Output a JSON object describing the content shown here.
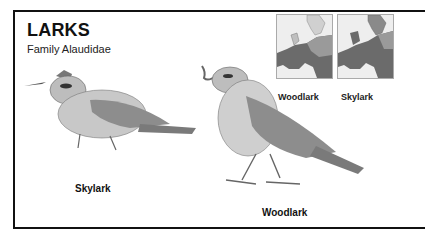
{
  "header": {
    "title": "LARKS",
    "subtitle": "Family Alaudidae"
  },
  "maps": [
    {
      "label": "Woodlark",
      "range_color": "#6b6b6b",
      "land_color": "#d8d8d8"
    },
    {
      "label": "Skylark",
      "range_color": "#6b6b6b",
      "land_color": "#d8d8d8"
    }
  ],
  "birds": [
    {
      "label": "Skylark"
    },
    {
      "label": "Woodlark"
    }
  ]
}
